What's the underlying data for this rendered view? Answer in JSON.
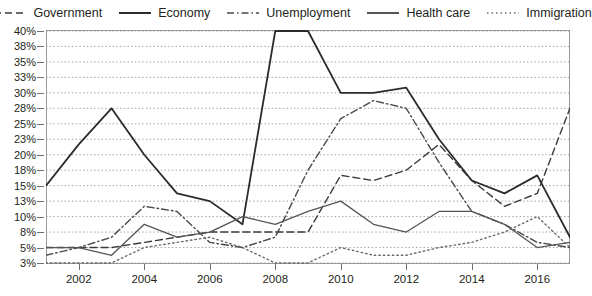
{
  "chart_data": {
    "type": "line",
    "title": "",
    "subtitle": "",
    "xlabel": "",
    "ylabel": "",
    "xlim": [
      2001,
      2017
    ],
    "ylim": [
      3,
      40
    ],
    "grid": true,
    "legend_position": "top-center",
    "x": [
      2001,
      2002,
      2003,
      2004,
      2005,
      2006,
      2007,
      2008,
      2009,
      2010,
      2011,
      2012,
      2013,
      2014,
      2015,
      2016,
      2017
    ],
    "xticks": [
      2002,
      2004,
      2006,
      2008,
      2010,
      2012,
      2014,
      2016
    ],
    "xtick_labels": [
      "2002",
      "2004",
      "2006",
      "2008",
      "2010",
      "2012",
      "2014",
      "2016"
    ],
    "yticks": [
      3,
      5,
      8,
      10,
      13,
      15,
      18,
      20,
      23,
      25,
      28,
      30,
      33,
      35,
      38,
      40
    ],
    "ytick_labels": [
      "3%",
      "5%",
      "8%",
      "10%",
      "13%",
      "15%",
      "18%",
      "20%",
      "23%",
      "25%",
      "28%",
      "30%",
      "33%",
      "35%",
      "38%",
      "40%"
    ],
    "series": [
      {
        "name": "Government",
        "style": "dashed",
        "color": "#3b3b3b",
        "width": 1.4,
        "values": [
          5,
          5,
          5,
          6,
          7,
          8,
          8,
          8,
          8,
          17,
          16,
          18,
          22,
          16,
          12,
          14,
          28
        ]
      },
      {
        "name": "Economy",
        "style": "solid",
        "color": "#2b2b2b",
        "width": 1.8,
        "values": [
          15,
          22,
          28,
          20,
          14,
          13,
          9,
          40,
          41,
          30,
          30,
          31,
          23,
          16,
          14,
          17,
          7
        ]
      },
      {
        "name": "Unemployment",
        "style": "dashdot",
        "color": "#4a4a4a",
        "width": 1.4,
        "values": [
          4,
          5,
          7,
          12,
          11,
          6,
          5,
          7,
          18,
          26,
          29,
          28,
          19,
          11,
          9,
          6,
          5
        ]
      },
      {
        "name": "Health care",
        "style": "solid",
        "color": "#555555",
        "width": 1.3,
        "values": [
          5,
          5,
          4,
          9,
          7,
          8,
          10,
          9,
          11,
          13,
          9,
          8,
          11,
          11,
          9,
          5,
          6
        ]
      },
      {
        "name": "Immigration",
        "style": "dotted",
        "color": "#6a6a6a",
        "width": 1.4,
        "values": [
          3,
          3,
          3,
          5,
          6,
          7,
          5,
          3,
          3,
          5,
          4,
          4,
          5,
          6,
          8,
          10,
          5
        ]
      }
    ]
  },
  "legend": {
    "items": [
      {
        "label": "Government",
        "style": "dashed"
      },
      {
        "label": "Economy",
        "style": "solid"
      },
      {
        "label": "Unemployment",
        "style": "dashdot"
      },
      {
        "label": "Health care",
        "style": "solid"
      },
      {
        "label": "Immigration",
        "style": "dotted"
      }
    ]
  }
}
